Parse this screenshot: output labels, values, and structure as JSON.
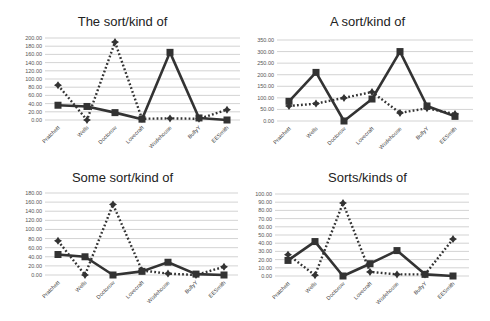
{
  "chart_data": [
    {
      "type": "line",
      "title": "The sort/kind of",
      "categories": [
        "Pratchett",
        "Wells",
        "Doctorow",
        "Lovecraft",
        "Wodehouse",
        "BullyY",
        "EESmith"
      ],
      "xlabel": "",
      "ylabel": "",
      "ylim": [
        0,
        200
      ],
      "yticks": [
        "0.00",
        "20.00",
        "40.00",
        "60.00",
        "80.00",
        "100.00",
        "120.00",
        "140.00",
        "160.00",
        "180.00",
        "200.00"
      ],
      "grid": true,
      "legend": null,
      "series": [
        {
          "name": "solid (square markers)",
          "style": "solid",
          "marker": "square",
          "values": [
            36,
            33,
            18,
            2,
            165,
            5,
            0
          ]
        },
        {
          "name": "dotted (star markers)",
          "style": "dotted",
          "marker": "star",
          "values": [
            85,
            0,
            190,
            3,
            4,
            3,
            25
          ]
        }
      ]
    },
    {
      "type": "line",
      "title": "A sort/kind of",
      "categories": [
        "Pratchett",
        "Wells",
        "Doctorow",
        "Lovecraft",
        "Wodehouse",
        "BullyY",
        "EESmith"
      ],
      "xlabel": "",
      "ylabel": "",
      "ylim": [
        0,
        350
      ],
      "yticks": [
        "0.00",
        "50.00",
        "100.00",
        "150.00",
        "200.00",
        "250.00",
        "300.00",
        "350.00"
      ],
      "grid": true,
      "legend": null,
      "series": [
        {
          "name": "solid (square markers)",
          "style": "solid",
          "marker": "square",
          "values": [
            85,
            210,
            0,
            95,
            300,
            65,
            20
          ]
        },
        {
          "name": "dotted (star markers)",
          "style": "dotted",
          "marker": "star",
          "values": [
            65,
            75,
            100,
            125,
            35,
            55,
            30
          ]
        }
      ]
    },
    {
      "type": "line",
      "title": "Some sort/kind of",
      "categories": [
        "Pratchett",
        "Wells",
        "Doctorow",
        "Lovecraft",
        "Wodehouse",
        "BullyY",
        "EESmith"
      ],
      "xlabel": "",
      "ylabel": "",
      "ylim": [
        0,
        180
      ],
      "yticks": [
        "0.00",
        "20.00",
        "40.00",
        "60.00",
        "80.00",
        "100.00",
        "120.00",
        "140.00",
        "160.00",
        "180.00"
      ],
      "grid": true,
      "legend": null,
      "series": [
        {
          "name": "solid (square markers)",
          "style": "solid",
          "marker": "square",
          "values": [
            45,
            40,
            0,
            8,
            28,
            2,
            0
          ]
        },
        {
          "name": "dotted (star markers)",
          "style": "dotted",
          "marker": "star",
          "values": [
            75,
            0,
            155,
            10,
            3,
            0,
            18
          ]
        }
      ]
    },
    {
      "type": "line",
      "title": "Sorts/kinds of",
      "categories": [
        "Pratchett",
        "Wells",
        "Doctorow",
        "Lovecraft",
        "Wodehouse",
        "BullyY",
        "EESmith"
      ],
      "xlabel": "",
      "ylabel": "",
      "ylim": [
        0,
        100
      ],
      "yticks": [
        "0.00",
        "10.00",
        "20.00",
        "30.00",
        "40.00",
        "50.00",
        "60.00",
        "70.00",
        "80.00",
        "90.00",
        "100.00"
      ],
      "grid": true,
      "legend": null,
      "series": [
        {
          "name": "solid (square markers)",
          "style": "solid",
          "marker": "square",
          "values": [
            19,
            42,
            0,
            15,
            31,
            2,
            0
          ]
        },
        {
          "name": "dotted (star markers)",
          "style": "dotted",
          "marker": "star",
          "values": [
            26,
            1,
            89,
            5,
            2,
            2,
            45
          ]
        }
      ]
    }
  ],
  "colors": {
    "line": "#333333",
    "grid": "#c8c8c8",
    "text": "#222222"
  }
}
